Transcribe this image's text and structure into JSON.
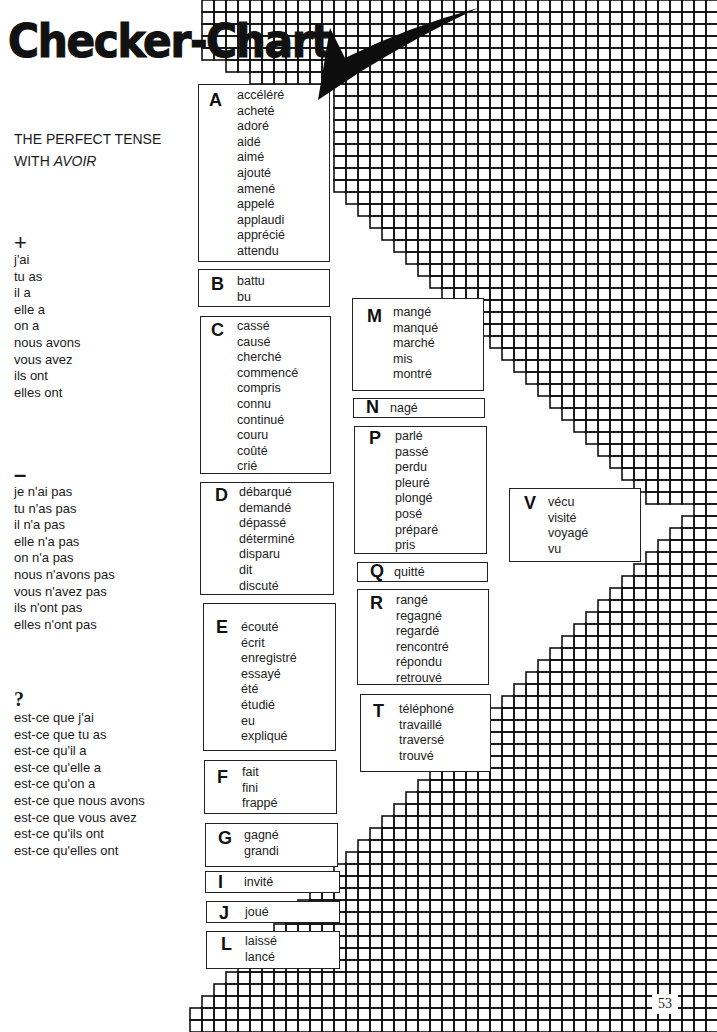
{
  "title": "Checker-Chart",
  "subtitle": {
    "line1": "THE PERFECT TENSE",
    "line2_prefix": "WITH ",
    "line2_italic": "AVOIR"
  },
  "affirmative": {
    "symbol": "+",
    "lines": [
      "j'ai",
      "tu as",
      "il a",
      "elle a",
      "on a",
      "nous avons",
      "vous avez",
      "ils ont",
      "elles ont"
    ]
  },
  "negative": {
    "symbol": "–",
    "lines": [
      "je n'ai pas",
      "tu n'as pas",
      "il n'a pas",
      "elle n'a pas",
      "on n'a pas",
      "nous n'avons pas",
      "vous n'avez pas",
      "ils n'ont pas",
      "elles n'ont pas"
    ]
  },
  "question": {
    "symbol": "?",
    "lines": [
      "est-ce que j'ai",
      "est-ce que tu as",
      "est-ce qu'il a",
      "est-ce qu'elle a",
      "est-ce qu'on a",
      "est-ce que nous avons",
      "est-ce que vous avez",
      "est-ce qu'ils ont",
      "est-ce qu'elles ont"
    ]
  },
  "boxes": [
    {
      "letter": "A",
      "words": [
        "accéléré",
        "acheté",
        "adoré",
        "aidé",
        "aimé",
        "ajouté",
        "amené",
        "appelé",
        "applaudi",
        "apprécié",
        "attendu"
      ]
    },
    {
      "letter": "B",
      "words": [
        "battu",
        "bu"
      ]
    },
    {
      "letter": "C",
      "words": [
        "cassé",
        "causé",
        "cherché",
        "commencé",
        "compris",
        "connu",
        "continué",
        "couru",
        "coûté",
        "crié"
      ]
    },
    {
      "letter": "D",
      "words": [
        "débarqué",
        "demandé",
        "dépassé",
        "déterminé",
        "disparu",
        "dit",
        "discuté"
      ]
    },
    {
      "letter": "E",
      "words": [
        "écouté",
        "écrit",
        "enregistré",
        "essayé",
        "été",
        "étudié",
        "eu",
        "expliqué"
      ]
    },
    {
      "letter": "F",
      "words": [
        "fait",
        "fini",
        "frappé"
      ]
    },
    {
      "letter": "G",
      "words": [
        "gagné",
        "grandi"
      ]
    },
    {
      "letter": "I",
      "words": [
        "invité"
      ]
    },
    {
      "letter": "J",
      "words": [
        "joué"
      ]
    },
    {
      "letter": "L",
      "words": [
        "laissé",
        "lancé"
      ]
    },
    {
      "letter": "M",
      "words": [
        "mangé",
        "manqué",
        "marché",
        "mis",
        "montré"
      ]
    },
    {
      "letter": "N",
      "words": [
        "nagé"
      ]
    },
    {
      "letter": "P",
      "words": [
        "parlé",
        "passé",
        "perdu",
        "pleuré",
        "plongé",
        "posé",
        "préparé",
        "pris"
      ]
    },
    {
      "letter": "Q",
      "words": [
        "quitté"
      ]
    },
    {
      "letter": "R",
      "words": [
        "rangé",
        "regagné",
        "regardé",
        "rencontré",
        "répondu",
        "retrouvé"
      ]
    },
    {
      "letter": "T",
      "words": [
        "téléphoné",
        "travaillé",
        "traversé",
        "trouvé"
      ]
    },
    {
      "letter": "V",
      "words": [
        "vécu",
        "visité",
        "voyagé",
        "vu"
      ]
    }
  ],
  "page_number": "53",
  "colors": {
    "ink": "#111111",
    "paper": "#ffffff"
  }
}
